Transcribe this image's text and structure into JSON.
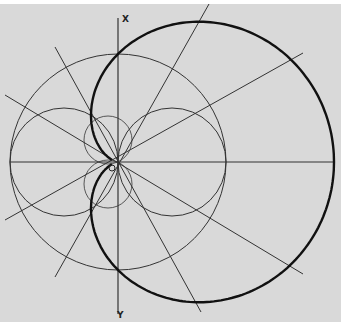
{
  "figure": {
    "type": "cardioid construction",
    "labels": {
      "x_axis": "X",
      "y_axis": "Y",
      "origin": "O"
    },
    "colors": {
      "background": "#d9d9d9",
      "line": "#333333",
      "curve": "#111111"
    },
    "geometry": {
      "origin": [
        118,
        162
      ],
      "base_circle_radius": 108,
      "small_circle_radius": 54,
      "small_circle_centers": [
        [
          64,
          162
        ],
        [
          172,
          162
        ]
      ],
      "cardioid": "r = a(1 + cos θ), a = 108",
      "ray_angles_deg": [
        27,
        63,
        -27,
        -63
      ]
    }
  }
}
